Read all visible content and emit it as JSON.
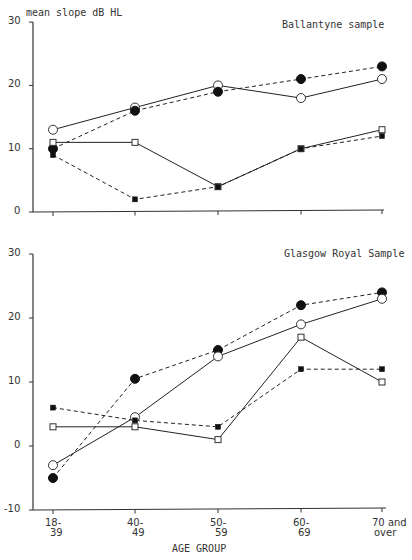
{
  "chart_data": [
    {
      "type": "line",
      "title": "Ballantyne sample",
      "ylabel": "mean slope dB HL",
      "xlabel": "AGE GROUP",
      "categories": [
        "18-39",
        "40-49",
        "50-59",
        "60-69",
        "70 and over"
      ],
      "ylim": [
        0,
        30
      ],
      "yticks": [
        0,
        10,
        20,
        30
      ],
      "grid": false,
      "series": [
        {
          "name": "open circle (solid)",
          "marker": "open-circle",
          "line": "solid",
          "values": [
            13,
            16.5,
            20,
            18,
            21
          ]
        },
        {
          "name": "filled circle (dashed)",
          "marker": "filled-circle",
          "line": "dashed",
          "values": [
            10,
            16,
            19,
            21,
            23
          ]
        },
        {
          "name": "open square (solid)",
          "marker": "open-square",
          "line": "solid",
          "values": [
            11,
            11,
            4,
            10,
            13
          ]
        },
        {
          "name": "filled square (dashed)",
          "marker": "filled-square",
          "line": "dashed",
          "values": [
            9,
            2,
            4,
            10,
            12
          ]
        }
      ]
    },
    {
      "type": "line",
      "title": "Glasgow Royal Sample",
      "ylabel": "",
      "xlabel": "AGE GROUP",
      "categories": [
        "18-39",
        "40-49",
        "50-59",
        "60-69",
        "70 and over"
      ],
      "ylim": [
        -10,
        30
      ],
      "yticks": [
        -10,
        0,
        10,
        20,
        30
      ],
      "grid": false,
      "series": [
        {
          "name": "filled circle (dashed)",
          "marker": "filled-circle",
          "line": "dashed",
          "values": [
            -5,
            10.5,
            15,
            22,
            24
          ]
        },
        {
          "name": "open circle (solid)",
          "marker": "open-circle",
          "line": "solid",
          "values": [
            -3,
            4.5,
            14,
            19,
            23
          ]
        },
        {
          "name": "open square (solid)",
          "marker": "open-square",
          "line": "solid",
          "values": [
            3,
            3,
            1,
            17,
            10
          ]
        },
        {
          "name": "filled square (dashed)",
          "marker": "filled-square",
          "line": "dashed",
          "values": [
            6,
            4,
            3,
            12,
            12
          ]
        }
      ]
    }
  ],
  "labels": {
    "ylabel": "mean slope dB HL",
    "top_title": "Ballantyne sample",
    "bottom_title": "Glasgow Royal Sample",
    "xlabel": "AGE GROUP",
    "x_line1": [
      "18-",
      "40-",
      "50-",
      "60-",
      "70 and"
    ],
    "x_line2": [
      "39",
      "49",
      "59",
      "69",
      "over"
    ]
  }
}
